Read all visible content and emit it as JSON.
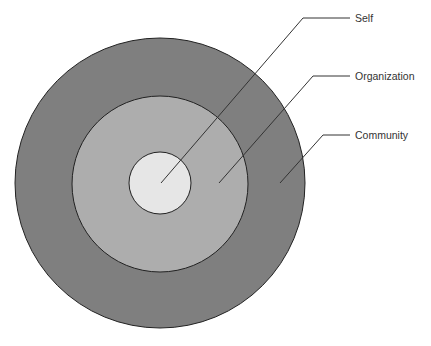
{
  "diagram": {
    "type": "concentric-circles",
    "colors": {
      "community": "#7f7f7f",
      "organization": "#aeaeae",
      "self": "#e6e6e6",
      "stroke": "#222222",
      "leader": "#333333"
    },
    "layers": [
      {
        "label": "Self"
      },
      {
        "label": "Organization"
      },
      {
        "label": "Community"
      }
    ]
  }
}
